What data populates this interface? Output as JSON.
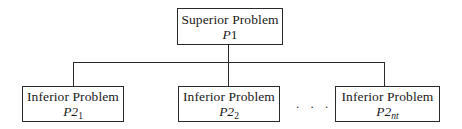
{
  "diagram": {
    "type": "hierarchy",
    "root": {
      "title": "Superior Problem",
      "label_main": "P",
      "label_sub": "1"
    },
    "children": [
      {
        "title": "Inferior Problem",
        "label_main": "P2",
        "label_sub": "1"
      },
      {
        "title": "Inferior Problem",
        "label_main": "P2",
        "label_sub": "2"
      },
      {
        "title": "Inferior Problem",
        "label_main": "P2",
        "label_sub": "nt"
      }
    ],
    "ellipsis": ". . .",
    "colors": {
      "stroke": "#2a2a2a",
      "background": "#ffffff",
      "text": "#1a1a1a"
    }
  }
}
